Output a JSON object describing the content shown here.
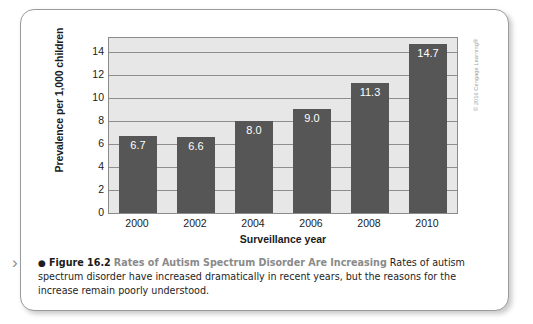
{
  "figure": {
    "marker_glyph": "›",
    "bullet": "●",
    "number": "Figure 16.2",
    "title": "Rates of Autism Spectrum Disorder Are Increasing",
    "body": "Rates of autism spectrum disorder have increased dramatically in recent years, but the reasons for the increase remain poorly understood.",
    "copyright": "© 2016 Cengage Learning®"
  },
  "chart_data": {
    "type": "bar",
    "title": "",
    "xlabel": "Surveillance year",
    "ylabel": "Prevalence per 1,000 children",
    "categories": [
      "2000",
      "2002",
      "2004",
      "2006",
      "2008",
      "2010"
    ],
    "values": [
      6.7,
      6.6,
      8.0,
      9.0,
      11.3,
      14.7
    ],
    "value_labels": [
      "6.7",
      "6.6",
      "8.0",
      "9.0",
      "11.3",
      "14.7"
    ],
    "yticks": [
      0,
      2,
      4,
      6,
      8,
      10,
      12,
      14
    ],
    "ytick_labels": [
      "0",
      "2",
      "4",
      "6",
      "8",
      "10",
      "12",
      "14"
    ],
    "ylim": [
      0,
      15.2
    ],
    "grid": true,
    "legend": "none",
    "bar_color": "#565656",
    "plot_background": "#e7e7e7",
    "gridline_color": "#8e8e8e"
  }
}
